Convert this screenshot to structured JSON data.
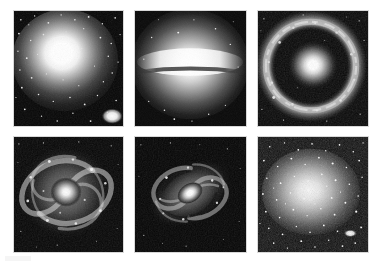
{
  "figure": {
    "background_color": "#ffffff",
    "columns": 3,
    "rows": 2,
    "panel_count": 6,
    "colormap": "grayscale"
  },
  "panels": [
    {
      "id": "panel-1",
      "position": "row1-col1",
      "morphology": "elliptical",
      "caption": "Elliptical galaxy with smooth bright core",
      "x": 13,
      "y": 10,
      "width": 111,
      "height": 117,
      "core_color": "#ffffff",
      "background_color": "#070707",
      "features": [
        "bright smooth nucleus",
        "dense foreground star field",
        "bright companion blob at lower right"
      ],
      "core": {
        "cx": 52,
        "cy": 50,
        "rx": 30,
        "ry": 28
      },
      "companion": {
        "cx": 100,
        "cy": 107,
        "rx": 7,
        "ry": 5
      },
      "star_count": 150
    },
    {
      "id": "panel-2",
      "position": "row1-col2",
      "morphology": "edge-on lenticular / sombrero",
      "caption": "Edge-on disk galaxy with dark dust lane",
      "x": 134,
      "y": 10,
      "width": 113,
      "height": 117,
      "core_color": "#ffffff",
      "background_color": "#0a0a0a",
      "features": [
        "luminous bulge",
        "flat dark dust lane across the midplane",
        "extended halo glow"
      ],
      "core": {
        "cx": 56,
        "cy": 52,
        "rx": 46,
        "ry": 38
      },
      "dust_lane": {
        "cy": 60,
        "thickness": 4
      },
      "star_count": 40
    },
    {
      "id": "panel-3",
      "position": "row1-col3",
      "morphology": "ring galaxy",
      "caption": "Ring galaxy with compact nucleus inside a clumpy ring",
      "x": 257,
      "y": 10,
      "width": 112,
      "height": 117,
      "core_color": "#ffffff",
      "background_color": "#080808",
      "features": [
        "compact bright nucleus",
        "detached star-forming ring",
        "dark gap between nucleus and ring"
      ],
      "core": {
        "cx": 56,
        "cy": 54,
        "rx": 10,
        "ry": 10
      },
      "ring": {
        "cx": 54,
        "cy": 54,
        "rx": 44,
        "ry": 43,
        "width": 9
      },
      "star_count": 90
    },
    {
      "id": "panel-4",
      "position": "row2-col1",
      "morphology": "face-on grand-design spiral",
      "caption": "Face-on multi-arm spiral galaxy",
      "x": 13,
      "y": 136,
      "width": 111,
      "height": 117,
      "core_color": "#f6f6f6",
      "background_color": "#060606",
      "features": [
        "bright small bulge",
        "multiple tightly wound spiral arms",
        "knotty HII regions along arms"
      ],
      "core": {
        "cx": 53,
        "cy": 55,
        "rx": 11,
        "ry": 10
      },
      "arm_count": 4,
      "star_count": 70
    },
    {
      "id": "panel-5",
      "position": "row2-col2",
      "morphology": "inclined spiral",
      "caption": "Tilted spiral galaxy with flocculent arms",
      "x": 134,
      "y": 136,
      "width": 113,
      "height": 117,
      "core_color": "#ffffff",
      "background_color": "#050505",
      "features": [
        "elongated inclined disk",
        "bright elongated nucleus",
        "dark dust patches in the arms"
      ],
      "core": {
        "cx": 56,
        "cy": 57,
        "rx": 10,
        "ry": 7
      },
      "inclination_angle_deg": -32,
      "arm_count": 4,
      "star_count": 50
    },
    {
      "id": "panel-6",
      "position": "row2-col3",
      "morphology": "irregular / dwarf",
      "caption": "Irregular dwarf galaxy resolved into individual stars",
      "x": 257,
      "y": 136,
      "width": 112,
      "height": 117,
      "core_color": "#fafafa",
      "background_color": "#101010",
      "features": [
        "diffuse amorphous glow",
        "resolved stellar population",
        "bright knot at lower right"
      ],
      "core": {
        "cx": 54,
        "cy": 56,
        "rx": 36,
        "ry": 30
      },
      "knot": {
        "cx": 94,
        "cy": 98,
        "rx": 5,
        "ry": 3
      },
      "star_count": 400
    }
  ]
}
